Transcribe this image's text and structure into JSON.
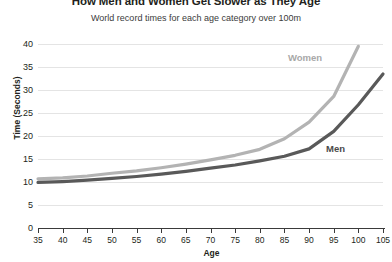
{
  "chart_data": {
    "type": "line",
    "title": "How Men and Women Get Slower as They Age",
    "subtitle": "World record times for each age category over 100m",
    "xlabel": "Age",
    "ylabel": "Time (Seconds)",
    "xlim": [
      35,
      105
    ],
    "ylim": [
      0,
      40
    ],
    "grid": true,
    "legend_position": "inline-annotation",
    "x": [
      35,
      40,
      45,
      50,
      55,
      60,
      65,
      70,
      75,
      80,
      85,
      90,
      95,
      100,
      105
    ],
    "xticks": [
      "35",
      "40",
      "45",
      "50",
      "55",
      "60",
      "65",
      "70",
      "75",
      "80",
      "85",
      "90",
      "95",
      "100",
      "105"
    ],
    "yticks": [
      "0",
      "5",
      "10",
      "15",
      "20",
      "25",
      "30",
      "35",
      "40"
    ],
    "series": [
      {
        "name": "Women",
        "color": "#b3b3b3",
        "values": [
          10.7,
          10.9,
          11.3,
          11.9,
          12.4,
          13.1,
          13.9,
          14.8,
          15.8,
          17.1,
          19.4,
          23.0,
          28.6,
          39.5,
          null
        ]
      },
      {
        "name": "Men",
        "color": "#595959",
        "values": [
          9.9,
          10.1,
          10.4,
          10.8,
          11.2,
          11.7,
          12.3,
          13.0,
          13.7,
          14.6,
          15.6,
          17.2,
          21.0,
          26.8,
          33.5
        ]
      }
    ],
    "annotations": [
      {
        "text": "Women",
        "x": 97,
        "y": 37.2
      },
      {
        "text": "Men",
        "x": 101,
        "y": 17.5
      }
    ]
  },
  "colors": {
    "women_line": "#b3b3b3",
    "men_line": "#595959",
    "gridline": "#e4e4e4",
    "axis": "#3a3a3a",
    "text": "#231f20",
    "background": "#ffffff"
  }
}
